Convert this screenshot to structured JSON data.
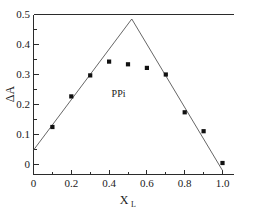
{
  "chart_data": {
    "type": "scatter",
    "title": "",
    "xlabel": "X",
    "xlabel_sub": "L",
    "ylabel": "ΔA",
    "xlim": [
      0,
      1.0
    ],
    "ylim": [
      0,
      0.5
    ],
    "grid": false,
    "legend": "none",
    "annotations": [
      {
        "text": "PPi",
        "x": 0.45,
        "y": 0.225
      }
    ],
    "xticks": [
      0,
      0.2,
      0.4,
      0.6,
      0.8,
      1.0
    ],
    "xtick_labels": [
      "0",
      "0.2",
      "0.4",
      "0.6",
      "0.8",
      "1.0"
    ],
    "xticks_minor": [
      0.1,
      0.3,
      0.5,
      0.7,
      0.9
    ],
    "yticks": [
      0,
      0.1,
      0.2,
      0.3,
      0.4,
      0.5
    ],
    "ytick_labels": [
      "0",
      "0.1",
      "0.2",
      "0.3",
      "0.4",
      "0.5"
    ],
    "yticks_minor": [
      0.05,
      0.15,
      0.25,
      0.35,
      0.45
    ],
    "series": [
      {
        "name": "PPi titration",
        "marker": "square",
        "marker_color": "#111111",
        "x": [
          0.1,
          0.2,
          0.3,
          0.4,
          0.5,
          0.6,
          0.7,
          0.8,
          0.9,
          1.0
        ],
        "values": [
          0.125,
          0.227,
          0.297,
          0.343,
          0.334,
          0.322,
          0.3,
          0.174,
          0.111,
          0.005
        ]
      }
    ],
    "fit_lines": [
      {
        "name": "ascending-limb",
        "color": "#555555",
        "x": [
          0.0,
          0.52
        ],
        "y": [
          0.048,
          0.485
        ]
      },
      {
        "name": "descending-limb",
        "color": "#555555",
        "x": [
          0.52,
          1.0
        ],
        "y": [
          0.485,
          -0.02
        ]
      }
    ]
  }
}
